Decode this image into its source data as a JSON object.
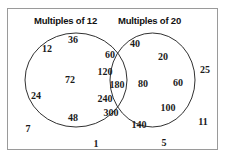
{
  "diagram": {
    "type": "venn-two-set",
    "universe_label": "",
    "left_set": {
      "title": "Multiples of 12",
      "only_members": [
        "12",
        "36",
        "72",
        "24",
        "48"
      ]
    },
    "right_set": {
      "title": "Multiples of 20",
      "only_members": [
        "40",
        "20",
        "80",
        "60",
        "100",
        "140"
      ]
    },
    "intersection": {
      "members": [
        "60",
        "120",
        "180",
        "240",
        "300"
      ]
    },
    "outside": {
      "members": [
        "7",
        "1",
        "5",
        "25",
        "11"
      ]
    }
  },
  "elements": [
    {
      "name": "element-12",
      "value": "12",
      "region": "left-only",
      "x": 47,
      "y": 48
    },
    {
      "name": "element-36",
      "value": "36",
      "region": "left-only",
      "x": 73,
      "y": 39
    },
    {
      "name": "element-72",
      "value": "72",
      "region": "left-only",
      "x": 70,
      "y": 79
    },
    {
      "name": "element-24",
      "value": "24",
      "region": "left-only",
      "x": 36,
      "y": 95
    },
    {
      "name": "element-48",
      "value": "48",
      "region": "left-only",
      "x": 73,
      "y": 117
    },
    {
      "name": "element-60-int",
      "value": "60",
      "region": "intersection",
      "x": 110,
      "y": 54
    },
    {
      "name": "element-120",
      "value": "120",
      "region": "intersection",
      "x": 105,
      "y": 71
    },
    {
      "name": "element-180",
      "value": "180",
      "region": "intersection",
      "x": 117,
      "y": 84
    },
    {
      "name": "element-240",
      "value": "240",
      "region": "intersection",
      "x": 105,
      "y": 98
    },
    {
      "name": "element-300",
      "value": "300",
      "region": "intersection",
      "x": 111,
      "y": 112
    },
    {
      "name": "element-40",
      "value": "40",
      "region": "right-only",
      "x": 135,
      "y": 43
    },
    {
      "name": "element-20",
      "value": "20",
      "region": "right-only",
      "x": 163,
      "y": 56
    },
    {
      "name": "element-80",
      "value": "80",
      "region": "right-only",
      "x": 143,
      "y": 83
    },
    {
      "name": "element-60r",
      "value": "60",
      "region": "right-only",
      "x": 178,
      "y": 82
    },
    {
      "name": "element-100",
      "value": "100",
      "region": "right-only",
      "x": 168,
      "y": 107
    },
    {
      "name": "element-140",
      "value": "140",
      "region": "right-only",
      "x": 139,
      "y": 124
    },
    {
      "name": "element-7",
      "value": "7",
      "region": "outside",
      "x": 28,
      "y": 128
    },
    {
      "name": "element-1",
      "value": "1",
      "region": "outside",
      "x": 96,
      "y": 143
    },
    {
      "name": "element-5",
      "value": "5",
      "region": "outside",
      "x": 164,
      "y": 142
    },
    {
      "name": "element-25",
      "value": "25",
      "region": "outside",
      "x": 205,
      "y": 69
    },
    {
      "name": "element-11",
      "value": "11",
      "region": "outside",
      "x": 203,
      "y": 121
    }
  ],
  "colors": {
    "border": "#9a9a9a",
    "circle_stroke": "#1a1a1a",
    "text": "#1a1a1a",
    "background": "#ffffff"
  }
}
